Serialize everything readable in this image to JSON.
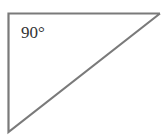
{
  "diagram": {
    "type": "right-triangle",
    "angle_label": "90°",
    "stroke_color": "#7a7a7a",
    "vertices": {
      "right_angle": [
        8.5,
        13.5
      ],
      "top_right": [
        160,
        13.5
      ],
      "bottom_left": [
        8.5,
        132
      ]
    }
  }
}
